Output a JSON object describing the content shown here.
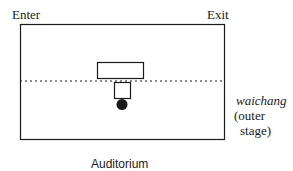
{
  "labels": {
    "enter": "Enter",
    "exit": "Exit",
    "waichang": "waichang",
    "outer_line1": "(outer",
    "outer_line2": "stage)",
    "auditorium": "Auditorium"
  },
  "colors": {
    "stroke": "#1a1a1a",
    "background": "#ffffff"
  }
}
